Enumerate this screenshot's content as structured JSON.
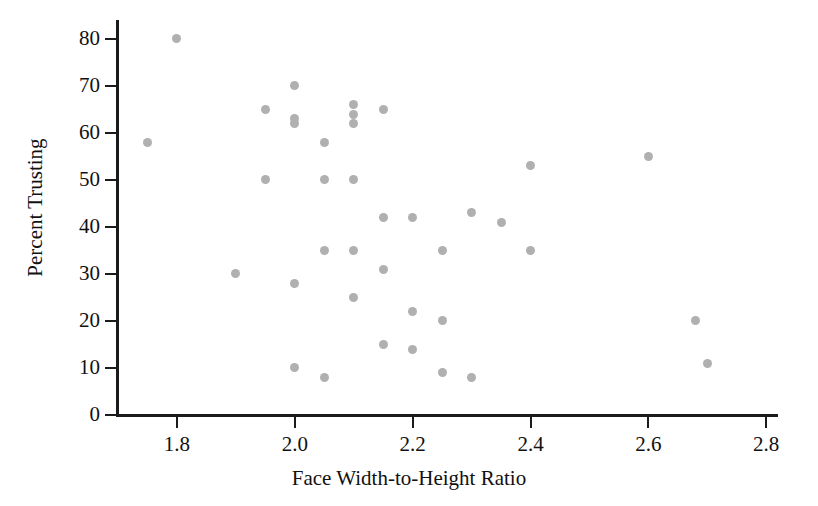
{
  "chart_data": {
    "type": "scatter",
    "title": "",
    "xlabel": "Face Width-to-Height Ratio",
    "ylabel": "Percent Trusting",
    "xlim": [
      1.7,
      2.82
    ],
    "ylim": [
      0,
      84
    ],
    "xticks": [
      "1.8",
      "2.0",
      "2.2",
      "2.4",
      "2.6",
      "2.8"
    ],
    "xtick_values": [
      1.8,
      2.0,
      2.2,
      2.4,
      2.6,
      2.8
    ],
    "yticks": [
      "0",
      "10",
      "20",
      "30",
      "40",
      "50",
      "60",
      "70",
      "80"
    ],
    "ytick_values": [
      0,
      10,
      20,
      30,
      40,
      50,
      60,
      70,
      80
    ],
    "grid": false,
    "legend": null,
    "marker_color": "#b0b0b0",
    "axis_color": "#1b1b1b",
    "background_color": "#ffffff",
    "n_points": 45,
    "points": [
      {
        "x": 1.75,
        "y": 58
      },
      {
        "x": 1.8,
        "y": 80
      },
      {
        "x": 1.9,
        "y": 30
      },
      {
        "x": 1.95,
        "y": 65
      },
      {
        "x": 1.95,
        "y": 50
      },
      {
        "x": 2.0,
        "y": 70
      },
      {
        "x": 2.0,
        "y": 63
      },
      {
        "x": 2.0,
        "y": 62
      },
      {
        "x": 2.0,
        "y": 28
      },
      {
        "x": 2.0,
        "y": 10
      },
      {
        "x": 2.05,
        "y": 58
      },
      {
        "x": 2.05,
        "y": 50
      },
      {
        "x": 2.05,
        "y": 35
      },
      {
        "x": 2.05,
        "y": 8
      },
      {
        "x": 2.1,
        "y": 66
      },
      {
        "x": 2.1,
        "y": 64
      },
      {
        "x": 2.1,
        "y": 62
      },
      {
        "x": 2.1,
        "y": 50
      },
      {
        "x": 2.1,
        "y": 35
      },
      {
        "x": 2.1,
        "y": 25
      },
      {
        "x": 2.15,
        "y": 65
      },
      {
        "x": 2.15,
        "y": 42
      },
      {
        "x": 2.15,
        "y": 31
      },
      {
        "x": 2.15,
        "y": 15
      },
      {
        "x": 2.2,
        "y": 42
      },
      {
        "x": 2.2,
        "y": 22
      },
      {
        "x": 2.2,
        "y": 14
      },
      {
        "x": 2.25,
        "y": 35
      },
      {
        "x": 2.25,
        "y": 20
      },
      {
        "x": 2.25,
        "y": 9
      },
      {
        "x": 2.3,
        "y": 43
      },
      {
        "x": 2.3,
        "y": 8
      },
      {
        "x": 2.35,
        "y": 41
      },
      {
        "x": 2.4,
        "y": 53
      },
      {
        "x": 2.4,
        "y": 35
      },
      {
        "x": 2.6,
        "y": 55
      },
      {
        "x": 2.68,
        "y": 20
      },
      {
        "x": 2.7,
        "y": 11
      }
    ]
  }
}
